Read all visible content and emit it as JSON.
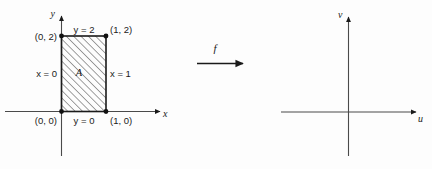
{
  "figure": {
    "background_color": "#fdfdfd",
    "ink_color": "#1a1a1a"
  },
  "domain_plot": {
    "name": "xy-plane",
    "axes": {
      "x_label": "x",
      "y_label": "y"
    },
    "region": {
      "label": "A",
      "fill": "hatched",
      "hatch_color": "#2b2b2b",
      "border_color": "#1a1a1a"
    },
    "edge_labels": {
      "top": "y = 2",
      "bottom": "y = 0",
      "left": "x = 0",
      "right": "x = 1"
    },
    "vertex_labels": {
      "bottom_left": "(0, 0)",
      "bottom_right": "(1, 0)",
      "top_left": "(0, 2)",
      "top_right": "(1, 2)"
    }
  },
  "mapping": {
    "label": "f",
    "arrow": "right-arrow"
  },
  "codomain_plot": {
    "name": "uv-plane",
    "axes": {
      "x_label": "u",
      "y_label": "v"
    }
  }
}
